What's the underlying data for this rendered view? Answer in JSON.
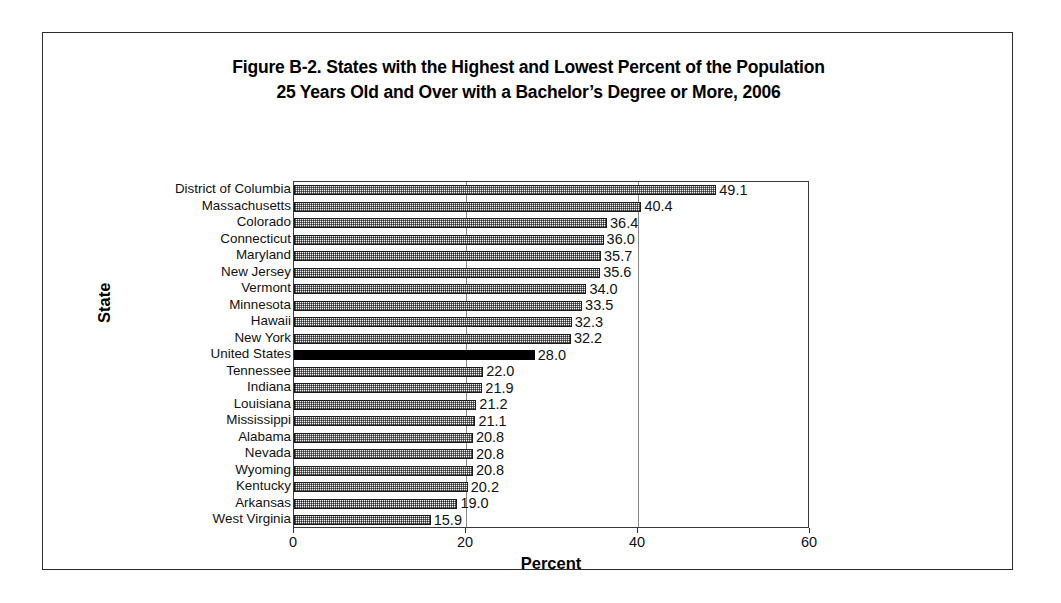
{
  "figure": {
    "title_line_1": "Figure B-2. States with the Highest and Lowest Percent of the Population",
    "title_line_2": "25 Years Old and Over with a Bachelor’s Degree or More, 2006"
  },
  "axes": {
    "x_title": "Percent",
    "y_title": "State",
    "x_tick_labels": [
      "0",
      "20",
      "40",
      "60"
    ]
  },
  "colors": {
    "bar_fill": "#b9b9b9",
    "bar_border": "#1a1a1a",
    "highlight_bar": "#000000",
    "gridline": "#8a8a8a",
    "frame": "#2b2b2b",
    "text": "#000000",
    "background": "#ffffff"
  },
  "chart_data": {
    "type": "bar",
    "orientation": "horizontal",
    "title": "Figure B-2. States with the Highest and Lowest Percent of the Population 25 Years Old and Over with a Bachelor’s Degree or More, 2006",
    "xlabel": "Percent",
    "ylabel": "State",
    "xlim": [
      0,
      60
    ],
    "xticks": [
      0,
      20,
      40,
      60
    ],
    "grid": true,
    "grid_axis": "x",
    "legend": false,
    "value_labels": true,
    "highlight_category": "United States",
    "categories": [
      "District of Columbia",
      "Massachusetts",
      "Colorado",
      "Connecticut",
      "Maryland",
      "New Jersey",
      "Vermont",
      "Minnesota",
      "Hawaii",
      "New York",
      "United States",
      "Tennessee",
      "Indiana",
      "Louisiana",
      "Mississippi",
      "Alabama",
      "Nevada",
      "Wyoming",
      "Kentucky",
      "Arkansas",
      "West Virginia"
    ],
    "values": [
      49.1,
      40.4,
      36.4,
      36.0,
      35.7,
      35.6,
      34.0,
      33.5,
      32.3,
      32.2,
      28.0,
      22.0,
      21.9,
      21.2,
      21.1,
      20.8,
      20.8,
      20.8,
      20.2,
      19.0,
      15.9
    ],
    "value_label_texts": [
      "49.1",
      "40.4",
      "36.4",
      "36.0",
      "35.7",
      "35.6",
      "34.0",
      "33.5",
      "32.3",
      "32.2",
      "28.0",
      "22.0",
      "21.9",
      "21.2",
      "21.1",
      "20.8",
      "20.8",
      "20.8",
      "20.2",
      "19.0",
      "15.9"
    ]
  }
}
